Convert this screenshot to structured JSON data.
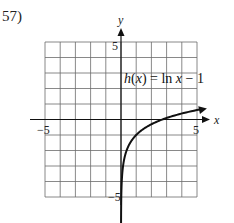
{
  "problem": {
    "number_label": "57)"
  },
  "chart_data": {
    "type": "line",
    "title": "",
    "function_label": "h(x) = ln x − 1",
    "xlabel": "x",
    "ylabel": "y",
    "xlim": [
      -5,
      5
    ],
    "ylim": [
      -5,
      5
    ],
    "grid": true,
    "grid_step": 1,
    "tick_labels": {
      "x_min": "−5",
      "x_max": "5",
      "y_max": "5",
      "y_min": "−5"
    },
    "series": [
      {
        "name": "h(x) = ln x − 1",
        "x": [
          0.007,
          0.05,
          0.1,
          0.25,
          0.5,
          1,
          1.5,
          2,
          2.718,
          3,
          4,
          5,
          5.6
        ],
        "y": [
          -5.96,
          -4.0,
          -3.3,
          -2.39,
          -1.69,
          -1.0,
          -0.59,
          -0.31,
          0.0,
          0.1,
          0.39,
          0.61,
          0.72
        ]
      }
    ],
    "asymptote": {
      "type": "vertical",
      "x": 0
    }
  }
}
